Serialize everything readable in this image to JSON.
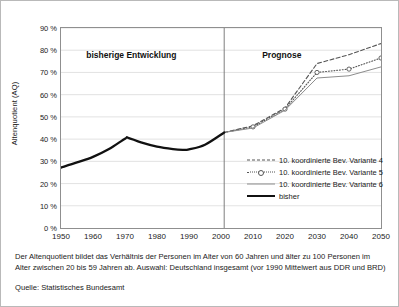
{
  "chart_data": {
    "type": "line",
    "title": "",
    "xlabel": "",
    "ylabel": "Altenquotient (AQ)",
    "xlim": [
      1950,
      2050
    ],
    "ylim": [
      0,
      90
    ],
    "grid": true,
    "legend_position": "inside-lower-right",
    "ytick_labels": [
      "0 %",
      "10 %",
      "20 %",
      "30 %",
      "40 %",
      "50 %",
      "60 %",
      "70 %",
      "80 %",
      "90 %"
    ],
    "ytick_values": [
      0,
      10,
      20,
      30,
      40,
      50,
      60,
      70,
      80,
      90
    ],
    "xtick_labels": [
      "1950",
      "1960",
      "1970",
      "1980",
      "1990",
      "2000",
      "2010",
      "2020",
      "2030",
      "2040",
      "2050"
    ],
    "xtick_values": [
      1950,
      1960,
      1970,
      1980,
      1990,
      2000,
      2010,
      2020,
      2030,
      2040,
      2050
    ],
    "annotations": [
      {
        "text": "bisherige Entwicklung",
        "x": 1972,
        "y": 78
      },
      {
        "text": "Prognose",
        "x": 2019,
        "y": 78
      }
    ],
    "divider": {
      "x": 2001,
      "label": ""
    },
    "series": [
      {
        "name": "10. koordinierte Bev. Variante 4",
        "style": "dashed",
        "color": "#555555",
        "x": [
          2001,
          2010,
          2020,
          2030,
          2040,
          2050
        ],
        "values": [
          43,
          46,
          54,
          74,
          78,
          83
        ]
      },
      {
        "name": "10. koordinierte Bev. Variante 5",
        "style": "dotted-marker",
        "color": "#555555",
        "x": [
          2001,
          2010,
          2020,
          2030,
          2040,
          2050
        ],
        "values": [
          43,
          45.5,
          53.5,
          70,
          71.5,
          76.5
        ]
      },
      {
        "name": "10. koordinierte Bev. Variante 6",
        "style": "solid-thin",
        "color": "#8c8c8c",
        "x": [
          2001,
          2010,
          2020,
          2030,
          2040,
          2050
        ],
        "values": [
          43,
          45,
          53,
          67.5,
          68.5,
          72.5
        ]
      },
      {
        "name": "bisher",
        "style": "solid-thick",
        "color": "#111111",
        "x": [
          1950,
          1955,
          1960,
          1965,
          1970,
          1971,
          1975,
          1980,
          1985,
          1988,
          1990,
          1995,
          2001
        ],
        "values": [
          27.2,
          29.5,
          32,
          35.5,
          40.2,
          40.6,
          38.5,
          36.6,
          35.5,
          35.2,
          35.4,
          37.5,
          43
        ]
      }
    ]
  },
  "legend": {
    "items": [
      {
        "label": "10. koordinierte Bev. Variante 4"
      },
      {
        "label": "10. koordinierte Bev. Variante 5"
      },
      {
        "label": "10. koordinierte Bev. Variante 6"
      },
      {
        "label": "bisher"
      }
    ]
  },
  "footer": {
    "footnote": "Der Altenquotient bildet das Verhältnis der Personen im Alter von 60 Jahren und älter zu 100 Personen im Alter zwischen 20 bis 59 Jahren ab. Auswahl: Deutschland insgesamt (vor 1990 Mittelwert aus DDR und BRD)",
    "source": "Quelle: Statistisches Bundesamt"
  }
}
